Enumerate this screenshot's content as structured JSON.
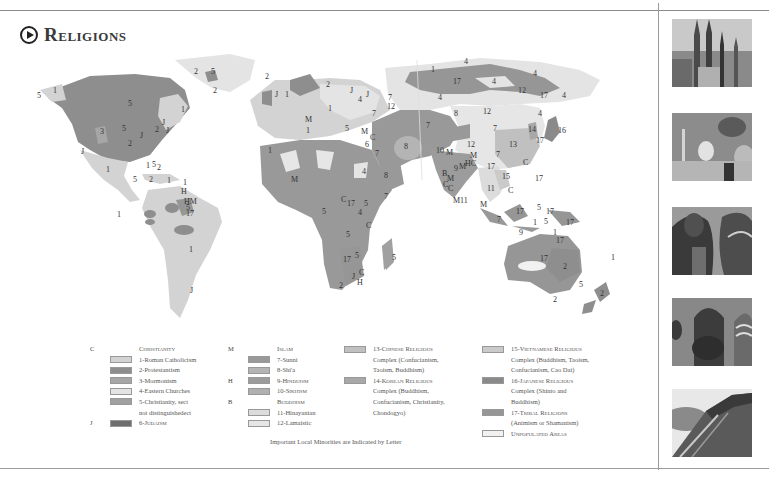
{
  "page": {
    "title": "Religions",
    "footnote": "Important Local Minorities are Indicated by Letter"
  },
  "colors": {
    "roman_catholicism": "#d3d3d3",
    "protestantism": "#8e8e8e",
    "mormonism": "#a6a6a6",
    "eastern_churches": "#e4e4e4",
    "christianity_sect_nd": "#a0a0a0",
    "judaism": "#6e6e6e",
    "sunni": "#999999",
    "shia": "#b4b4b4",
    "hinduism": "#9c9c9c",
    "sikhism": "#b0b0b0",
    "hinayanian": "#dcdcdc",
    "lamaistic": "#e6e6e6",
    "chinese_complex": "#c0c0c0",
    "korean_complex": "#a8a8a8",
    "vietnamese_complex": "#cacaca",
    "japanese_complex": "#8a8a8a",
    "tribal": "#969696",
    "unpopulated": "#f1f1f1"
  },
  "legend": {
    "col1": [
      {
        "letter": "C",
        "label": "Christianity",
        "heading": true
      },
      {
        "letter": "",
        "label": "1-Roman Catholicism",
        "swatch": "roman_catholicism"
      },
      {
        "letter": "",
        "label": "2-Protestantism",
        "swatch": "protestantism"
      },
      {
        "letter": "",
        "label": "3-Mormonism",
        "swatch": "mormonism"
      },
      {
        "letter": "",
        "label": "4-Eastern Churches",
        "swatch": "eastern_churches"
      },
      {
        "letter": "",
        "label": "5-Christianity, sect",
        "swatch": "christianity_sect_nd"
      },
      {
        "letter": "",
        "label": "not distinguishedect",
        "continuation": true
      },
      {
        "letter": "J",
        "label": "6-Judaism",
        "swatch": "judaism",
        "smallcaps": true
      }
    ],
    "col2": [
      {
        "letter": "M",
        "label": "Islam",
        "heading": true
      },
      {
        "letter": "",
        "label": "7-Sunni",
        "swatch": "sunni"
      },
      {
        "letter": "",
        "label": "8-Shi'a",
        "swatch": "shia"
      },
      {
        "letter": "H",
        "label": "9-Hinduism",
        "swatch": "hinduism",
        "smallcaps": true
      },
      {
        "letter": "",
        "label": "10-Sikhism",
        "swatch": "sikhism",
        "smallcaps": true
      },
      {
        "letter": "B",
        "label": "Buddhism",
        "heading": true
      },
      {
        "letter": "",
        "label": "11-Hinayanian",
        "swatch": "hinayanian"
      },
      {
        "letter": "",
        "label": "12-Lamaistic",
        "swatch": "lamaistic"
      }
    ],
    "col3": [
      {
        "label": "13-Chinese Religious",
        "swatch": "chinese_complex",
        "smallcaps": true
      },
      {
        "label": "Complex (Confucianism,",
        "continuation": true
      },
      {
        "label": "Taoism, Buddhism)",
        "continuation": true
      },
      {
        "label": "14-Korean Religious",
        "swatch": "korean_complex",
        "smallcaps": true
      },
      {
        "label": "Complex (Buddhism,",
        "continuation": true
      },
      {
        "label": "Confucianism, Christianity,",
        "continuation": true
      },
      {
        "label": "Chondogyo)",
        "continuation": true
      }
    ],
    "col4": [
      {
        "label": "15-Vietnamese Religious",
        "swatch": "vietnamese_complex",
        "smallcaps": true
      },
      {
        "label": "Complex (Buddhism, Taoism,",
        "continuation": true
      },
      {
        "label": "Confucianism, Cao Dai)",
        "continuation": true
      },
      {
        "label": "16-Japanese Religious",
        "swatch": "japanese_complex",
        "smallcaps": true
      },
      {
        "label": "Complex (Shinto and",
        "continuation": true
      },
      {
        "label": "Buddhism)",
        "continuation": true
      },
      {
        "label": "17-Tribal Religions",
        "swatch": "tribal",
        "smallcaps": true
      },
      {
        "label": "(Animism or Shamanism)",
        "continuation": true
      },
      {
        "label": "Unpopulated Areas",
        "swatch": "unpopulated",
        "smallcaps": true
      }
    ]
  },
  "map_labels": [
    {
      "t": "5",
      "x": 37,
      "y": 48
    },
    {
      "t": "1",
      "x": 53,
      "y": 43
    },
    {
      "t": "5",
      "x": 128,
      "y": 56
    },
    {
      "t": "1",
      "x": 181,
      "y": 62
    },
    {
      "t": "5",
      "x": 122,
      "y": 81
    },
    {
      "t": "2",
      "x": 155,
      "y": 82
    },
    {
      "t": "J",
      "x": 162,
      "y": 75
    },
    {
      "t": "J",
      "x": 166,
      "y": 83
    },
    {
      "t": "J",
      "x": 140,
      "y": 88
    },
    {
      "t": "3",
      "x": 100,
      "y": 84
    },
    {
      "t": "2",
      "x": 128,
      "y": 96
    },
    {
      "t": "J",
      "x": 81,
      "y": 104
    },
    {
      "t": "1",
      "x": 146,
      "y": 118
    },
    {
      "t": "5",
      "x": 152,
      "y": 117
    },
    {
      "t": "2",
      "x": 157,
      "y": 120
    },
    {
      "t": "1",
      "x": 106,
      "y": 122
    },
    {
      "t": "5",
      "x": 133,
      "y": 132
    },
    {
      "t": "2",
      "x": 149,
      "y": 132
    },
    {
      "t": "1",
      "x": 167,
      "y": 133
    },
    {
      "t": "1",
      "x": 183,
      "y": 135
    },
    {
      "t": "H",
      "x": 181,
      "y": 144
    },
    {
      "t": "HM",
      "x": 184,
      "y": 154
    },
    {
      "t": "5",
      "x": 186,
      "y": 160
    },
    {
      "t": "17",
      "x": 186,
      "y": 166
    },
    {
      "t": "1",
      "x": 117,
      "y": 167
    },
    {
      "t": "1",
      "x": 189,
      "y": 202
    },
    {
      "t": "J",
      "x": 190,
      "y": 243
    },
    {
      "t": "2",
      "x": 194,
      "y": 24
    },
    {
      "t": "5",
      "x": 211,
      "y": 24
    },
    {
      "t": "2",
      "x": 213,
      "y": 43
    },
    {
      "t": "2",
      "x": 265,
      "y": 29
    },
    {
      "t": "J",
      "x": 275,
      "y": 47
    },
    {
      "t": "1",
      "x": 285,
      "y": 47
    },
    {
      "t": "2",
      "x": 326,
      "y": 37
    },
    {
      "t": "J",
      "x": 350,
      "y": 43
    },
    {
      "t": "4",
      "x": 358,
      "y": 52
    },
    {
      "t": "J",
      "x": 366,
      "y": 47
    },
    {
      "t": "7",
      "x": 388,
      "y": 50
    },
    {
      "t": "12",
      "x": 387,
      "y": 59
    },
    {
      "t": "7",
      "x": 372,
      "y": 66
    },
    {
      "t": "1",
      "x": 328,
      "y": 61
    },
    {
      "t": "M",
      "x": 305,
      "y": 72
    },
    {
      "t": "1",
      "x": 306,
      "y": 83
    },
    {
      "t": "5",
      "x": 345,
      "y": 81
    },
    {
      "t": "M",
      "x": 361,
      "y": 84
    },
    {
      "t": "C",
      "x": 370,
      "y": 90
    },
    {
      "t": "6",
      "x": 365,
      "y": 97
    },
    {
      "t": "7",
      "x": 375,
      "y": 106
    },
    {
      "t": "8",
      "x": 404,
      "y": 99
    },
    {
      "t": "1",
      "x": 268,
      "y": 103
    },
    {
      "t": "8",
      "x": 384,
      "y": 128
    },
    {
      "t": "M",
      "x": 291,
      "y": 132
    },
    {
      "t": "4",
      "x": 362,
      "y": 124
    },
    {
      "t": "7",
      "x": 384,
      "y": 149
    },
    {
      "t": "C",
      "x": 341,
      "y": 152
    },
    {
      "t": "17",
      "x": 347,
      "y": 156
    },
    {
      "t": "5",
      "x": 364,
      "y": 156
    },
    {
      "t": "4",
      "x": 358,
      "y": 165
    },
    {
      "t": "5",
      "x": 322,
      "y": 164
    },
    {
      "t": "C",
      "x": 366,
      "y": 178
    },
    {
      "t": "5",
      "x": 346,
      "y": 187
    },
    {
      "t": "5",
      "x": 355,
      "y": 208
    },
    {
      "t": "17",
      "x": 343,
      "y": 212
    },
    {
      "t": "C",
      "x": 359,
      "y": 225
    },
    {
      "t": "J",
      "x": 352,
      "y": 229
    },
    {
      "t": "H",
      "x": 357,
      "y": 235
    },
    {
      "t": "2",
      "x": 339,
      "y": 238
    },
    {
      "t": "5",
      "x": 392,
      "y": 210
    },
    {
      "t": "1",
      "x": 431,
      "y": 22
    },
    {
      "t": "4",
      "x": 464,
      "y": 14
    },
    {
      "t": "17",
      "x": 453,
      "y": 34
    },
    {
      "t": "4",
      "x": 492,
      "y": 34
    },
    {
      "t": "4",
      "x": 533,
      "y": 26
    },
    {
      "t": "12",
      "x": 518,
      "y": 43
    },
    {
      "t": "17",
      "x": 540,
      "y": 48
    },
    {
      "t": "4",
      "x": 562,
      "y": 48
    },
    {
      "t": "4",
      "x": 438,
      "y": 50
    },
    {
      "t": "7",
      "x": 426,
      "y": 78
    },
    {
      "t": "8",
      "x": 454,
      "y": 66
    },
    {
      "t": "12",
      "x": 483,
      "y": 64
    },
    {
      "t": "4",
      "x": 538,
      "y": 66
    },
    {
      "t": "7",
      "x": 493,
      "y": 81
    },
    {
      "t": "14",
      "x": 528,
      "y": 82
    },
    {
      "t": "16",
      "x": 558,
      "y": 83
    },
    {
      "t": "17",
      "x": 536,
      "y": 93
    },
    {
      "t": "12",
      "x": 467,
      "y": 97
    },
    {
      "t": "13",
      "x": 509,
      "y": 97
    },
    {
      "t": "10",
      "x": 436,
      "y": 103
    },
    {
      "t": "M",
      "x": 446,
      "y": 105
    },
    {
      "t": "M",
      "x": 470,
      "y": 108
    },
    {
      "t": "7",
      "x": 496,
      "y": 107
    },
    {
      "t": "HC",
      "x": 465,
      "y": 116
    },
    {
      "t": "17",
      "x": 487,
      "y": 119
    },
    {
      "t": "9",
      "x": 454,
      "y": 121
    },
    {
      "t": "M",
      "x": 459,
      "y": 119
    },
    {
      "t": "B",
      "x": 442,
      "y": 126
    },
    {
      "t": "M",
      "x": 447,
      "y": 131
    },
    {
      "t": "C",
      "x": 443,
      "y": 137
    },
    {
      "t": "C",
      "x": 448,
      "y": 141
    },
    {
      "t": "C",
      "x": 523,
      "y": 115
    },
    {
      "t": "15",
      "x": 502,
      "y": 129
    },
    {
      "t": "17",
      "x": 535,
      "y": 131
    },
    {
      "t": "11",
      "x": 487,
      "y": 141
    },
    {
      "t": "C",
      "x": 508,
      "y": 143
    },
    {
      "t": "M11",
      "x": 453,
      "y": 153
    },
    {
      "t": "M",
      "x": 480,
      "y": 157
    },
    {
      "t": "17",
      "x": 516,
      "y": 164
    },
    {
      "t": "5",
      "x": 537,
      "y": 160
    },
    {
      "t": "17",
      "x": 546,
      "y": 164
    },
    {
      "t": "7",
      "x": 497,
      "y": 172
    },
    {
      "t": "1",
      "x": 533,
      "y": 175
    },
    {
      "t": "5",
      "x": 544,
      "y": 174
    },
    {
      "t": "17",
      "x": 566,
      "y": 175
    },
    {
      "t": "9",
      "x": 519,
      "y": 185
    },
    {
      "t": "1",
      "x": 553,
      "y": 185
    },
    {
      "t": "17",
      "x": 556,
      "y": 193
    },
    {
      "t": "1",
      "x": 611,
      "y": 210
    },
    {
      "t": "17",
      "x": 540,
      "y": 211
    },
    {
      "t": "2",
      "x": 563,
      "y": 219
    },
    {
      "t": "5",
      "x": 579,
      "y": 237
    },
    {
      "t": "2",
      "x": 553,
      "y": 252
    },
    {
      "t": "2",
      "x": 600,
      "y": 246
    }
  ]
}
